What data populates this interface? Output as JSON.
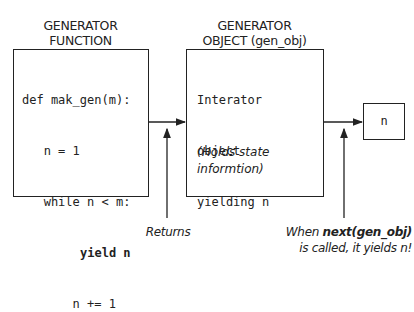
{
  "function_header": {
    "line1": "GENERATOR",
    "line2": "FUNCTION"
  },
  "object_header": {
    "line1": "GENERATOR",
    "line2": "OBJECT (gen_obj)"
  },
  "function_code": {
    "line1": "def mak_gen(m):",
    "line2": "   n = 1",
    "line3": "   while n < m:",
    "line4": "yield n",
    "line5": "       n += 1"
  },
  "object_body": {
    "line1": "Interator",
    "line2": "object",
    "line3": "yielding n",
    "note1": "(Holds state",
    "note2": "informtion)"
  },
  "output_box": {
    "label": "n"
  },
  "returns_caption": "Returns",
  "next_caption": {
    "pre": "When ",
    "bold": "next(gen_obj)",
    "line2": "is called, it yields n!"
  },
  "colors": {
    "line": "#222222",
    "background": "#ffffff"
  }
}
